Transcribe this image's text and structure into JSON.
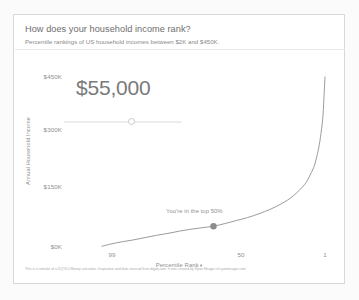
{
  "header": {
    "title": "How does your household income rank?",
    "subtitle": "Percentile rankings of US household incomes between $2K and $450K."
  },
  "readout": {
    "value_label": "$55,000",
    "slider_name": "income-slider"
  },
  "annotation": {
    "text": "You're in the top 50%"
  },
  "footer": {
    "text": "This is a remake of a DQYDJ Money calculator. Inspiration and data sourced from dqydj.com. It was created by Ryan Meager of ryanmeager.com"
  },
  "chart_data": {
    "type": "line",
    "title": "How does your household income rank?",
    "subtitle": "Percentile rankings of US household incomes between $2K and $450K.",
    "xlabel": "Percentile Rank",
    "ylabel": "Annual Household Income",
    "x_ticks": [
      "99",
      "50",
      "1"
    ],
    "x_tick_values": [
      99,
      50,
      1
    ],
    "y_ticks": [
      "$0K",
      "$150K",
      "$300K",
      "$450K"
    ],
    "y_tick_values": [
      0,
      150000,
      300000,
      450000
    ],
    "ylim": [
      0,
      450000
    ],
    "xlim": [
      99,
      1
    ],
    "x_axis_direction": "descending",
    "grid": false,
    "legend": false,
    "highlight_point": {
      "percentile": 50,
      "income": 55000,
      "label": "You're in the top 50%"
    },
    "series": [
      {
        "name": "US household income by percentile",
        "points": [
          {
            "percentile": 99,
            "income": 2000
          },
          {
            "percentile": 95,
            "income": 8000
          },
          {
            "percentile": 90,
            "income": 14000
          },
          {
            "percentile": 85,
            "income": 19000
          },
          {
            "percentile": 80,
            "income": 25000
          },
          {
            "percentile": 75,
            "income": 31000
          },
          {
            "percentile": 70,
            "income": 36000
          },
          {
            "percentile": 65,
            "income": 42000
          },
          {
            "percentile": 60,
            "income": 47000
          },
          {
            "percentile": 55,
            "income": 51000
          },
          {
            "percentile": 50,
            "income": 55000
          },
          {
            "percentile": 45,
            "income": 62000
          },
          {
            "percentile": 40,
            "income": 70000
          },
          {
            "percentile": 35,
            "income": 78000
          },
          {
            "percentile": 30,
            "income": 88000
          },
          {
            "percentile": 25,
            "income": 100000
          },
          {
            "percentile": 20,
            "income": 115000
          },
          {
            "percentile": 15,
            "income": 135000
          },
          {
            "percentile": 10,
            "income": 165000
          },
          {
            "percentile": 8,
            "income": 185000
          },
          {
            "percentile": 6,
            "income": 210000
          },
          {
            "percentile": 5,
            "income": 230000
          },
          {
            "percentile": 4,
            "income": 255000
          },
          {
            "percentile": 3,
            "income": 290000
          },
          {
            "percentile": 2,
            "income": 340000
          },
          {
            "percentile": 1.5,
            "income": 390000
          },
          {
            "percentile": 1,
            "income": 450000
          }
        ]
      }
    ],
    "colors": {
      "line": "#9b9b9b",
      "point": "#8c8c8c",
      "text": "#8f8f8f"
    }
  },
  "axis": {
    "y_title": "Annual Household Income",
    "x_title": "Percentile Rank",
    "caret": "♦"
  }
}
